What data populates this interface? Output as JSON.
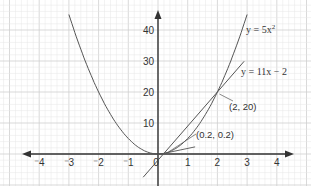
{
  "chart_data": {
    "type": "line",
    "title": "",
    "xlabel": "",
    "ylabel": "",
    "xlim": [
      -4.5,
      4.5
    ],
    "ylim": [
      -8,
      46
    ],
    "grid": true,
    "x_ticks": [
      {
        "value": -4,
        "label": "⁻4"
      },
      {
        "value": -3,
        "label": "⁻3"
      },
      {
        "value": -2,
        "label": "⁻2"
      },
      {
        "value": -1,
        "label": "⁻1"
      },
      {
        "value": 0,
        "label": "0"
      },
      {
        "value": 1,
        "label": "1"
      },
      {
        "value": 2,
        "label": "2"
      },
      {
        "value": 3,
        "label": "3"
      },
      {
        "value": 4,
        "label": "4"
      }
    ],
    "y_ticks": [
      {
        "value": 10,
        "label": "10"
      },
      {
        "value": 20,
        "label": "20"
      },
      {
        "value": 30,
        "label": "30"
      },
      {
        "value": 40,
        "label": "40"
      }
    ],
    "series": [
      {
        "name": "y = 5x²",
        "kind": "curve",
        "formula": "5*x^2",
        "x_range": [
          -3,
          3
        ],
        "label": "y = 5x²"
      },
      {
        "name": "y = 11x − 2",
        "kind": "line",
        "formula": "11*x-2",
        "x_range": [
          -0.5,
          2.9
        ],
        "label": "y = 11x − 2"
      },
      {
        "name": "tangent at (0.2, 0.2)",
        "kind": "line",
        "formula": "2*x-0.2",
        "x_range": [
          0,
          2
        ],
        "label": ""
      }
    ],
    "annotations": [
      {
        "text": "(2, 20)",
        "x": 2,
        "y": 20
      },
      {
        "text": "(0.2, 0.2)",
        "x": 0.2,
        "y": 0.2
      }
    ],
    "colors": {
      "grid_minor": "#e6e6e6",
      "grid_major": "#cfcfcf",
      "axis": "#333333",
      "curve": "#555555"
    }
  }
}
